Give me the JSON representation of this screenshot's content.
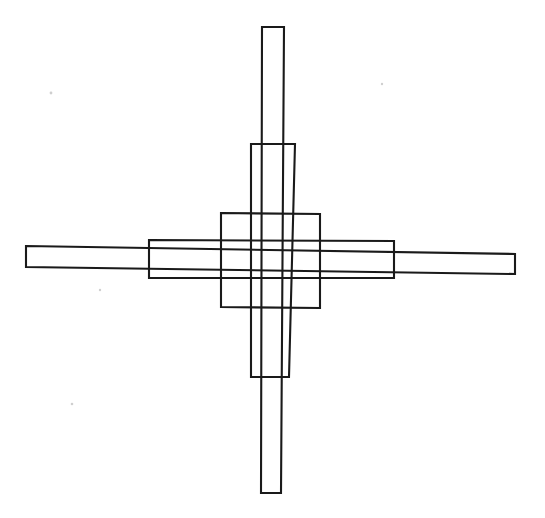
{
  "figure": {
    "canvas": {
      "width": 545,
      "height": 518
    },
    "colors": {
      "background": "#ffffff",
      "stroke": "#1a1a1a",
      "speck": "#cfcfcf"
    },
    "stroke_width": 2.1,
    "shape_count": 5,
    "shapes": [
      {
        "name": "long-horizontal-bar",
        "role": "longest horizontal rectangle, slanted slightly downward to the right",
        "points": "26,246 515,254 515,274 26,267"
      },
      {
        "name": "medium-horizontal-bar",
        "role": "medium horizontal rectangle",
        "points": "149,240 394,241 394,278 149,278"
      },
      {
        "name": "tall-vertical-bar",
        "role": "tallest vertical rectangle",
        "points": "262,27 284,27 281,493 261,493"
      },
      {
        "name": "medium-vertical-bar",
        "role": "medium vertical rectangle",
        "points": "251,144 295,144 289,377 251,377"
      },
      {
        "name": "center-square",
        "role": "central square",
        "points": "221,213 320,214 320,308 221,307"
      }
    ],
    "specks": [
      {
        "name": "speck-upper-left",
        "cx": 51,
        "cy": 93,
        "r": 1.4
      },
      {
        "name": "speck-mid-left",
        "cx": 100,
        "cy": 290,
        "r": 1.2
      },
      {
        "name": "speck-lower-left",
        "cx": 72,
        "cy": 404,
        "r": 1.3
      },
      {
        "name": "speck-upper-right",
        "cx": 382,
        "cy": 84,
        "r": 1.2
      }
    ]
  }
}
